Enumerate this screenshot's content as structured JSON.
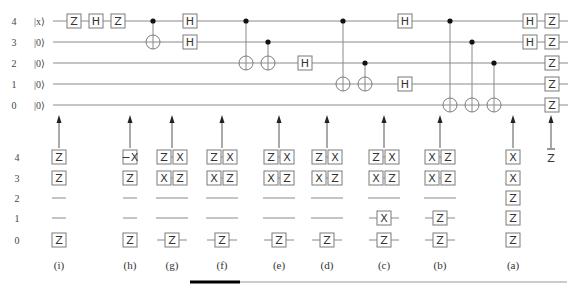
{
  "circuit": {
    "wires": [
      {
        "index": "4",
        "ket": "|x⟩",
        "y": 21
      },
      {
        "index": "3",
        "ket": "|0⟩",
        "y": 42
      },
      {
        "index": "2",
        "ket": "|0⟩",
        "y": 63
      },
      {
        "index": "1",
        "ket": "|0⟩",
        "y": 84
      },
      {
        "index": "0",
        "ket": "|0⟩",
        "y": 105
      }
    ],
    "wire_start_x": 53,
    "wire_end_x": 568,
    "gates": [
      {
        "label": "Z",
        "wire": 0,
        "x": 74
      },
      {
        "label": "H",
        "wire": 0,
        "x": 96
      },
      {
        "label": "Z",
        "wire": 0,
        "x": 118
      },
      {
        "label": "H",
        "wire": 0,
        "x": 190
      },
      {
        "label": "H",
        "wire": 1,
        "x": 190
      },
      {
        "label": "H",
        "wire": 2,
        "x": 305
      },
      {
        "label": "H",
        "wire": 0,
        "x": 405
      },
      {
        "label": "H",
        "wire": 3,
        "x": 405
      },
      {
        "label": "H",
        "wire": 0,
        "x": 530
      },
      {
        "label": "H",
        "wire": 1,
        "x": 530
      },
      {
        "label": "Z",
        "wire": 0,
        "x": 552
      },
      {
        "label": "Z",
        "wire": 1,
        "x": 552
      },
      {
        "label": "Z",
        "wire": 2,
        "x": 552
      },
      {
        "label": "Z",
        "wire": 3,
        "x": 552
      },
      {
        "label": "Z",
        "wire": 4,
        "x": 552
      }
    ],
    "cnots": [
      {
        "control": 0,
        "target": 1,
        "x": 153
      },
      {
        "control": 0,
        "target": 2,
        "x": 246
      },
      {
        "control": 1,
        "target": 2,
        "x": 268
      },
      {
        "control": 0,
        "target": 3,
        "x": 343
      },
      {
        "control": 2,
        "target": 3,
        "x": 365
      },
      {
        "control": 0,
        "target": 4,
        "x": 450
      },
      {
        "control": 1,
        "target": 4,
        "x": 472
      },
      {
        "control": 2,
        "target": 4,
        "x": 494
      }
    ]
  },
  "stabilizers": {
    "row_labels": [
      "4",
      "3",
      "2",
      "1",
      "0"
    ],
    "row_y": [
      157,
      178,
      198,
      218,
      240
    ],
    "caption_y": 265,
    "arrow_top_y": 115,
    "arrow_bottom_y": 148,
    "columns": [
      {
        "caption": "(i)",
        "x": 59,
        "rows": [
          [
            "Z"
          ],
          [
            "Z"
          ],
          [
            "—"
          ],
          [
            "—"
          ],
          [
            "Z"
          ]
        ],
        "wired": [
          false,
          false,
          false,
          false,
          false
        ]
      },
      {
        "caption": "(h)",
        "x": 130,
        "rows": [
          [
            "−X"
          ],
          [
            "Z"
          ],
          [
            "—"
          ],
          [
            "—"
          ],
          [
            "Z"
          ]
        ],
        "wired": [
          false,
          false,
          false,
          false,
          false
        ]
      },
      {
        "caption": "(g)",
        "x": 172,
        "rows": [
          [
            "Z",
            "X"
          ],
          [
            "X",
            "Z"
          ],
          [
            "—"
          ],
          [
            "—"
          ],
          [
            "Z"
          ]
        ],
        "wired": [
          false,
          false,
          false,
          false,
          true
        ]
      },
      {
        "caption": "(f)",
        "x": 222,
        "rows": [
          [
            "Z",
            "X"
          ],
          [
            "X",
            "Z"
          ],
          [
            "—"
          ],
          [
            "—"
          ],
          [
            "Z"
          ]
        ],
        "wired": [
          false,
          false,
          false,
          false,
          true
        ]
      },
      {
        "caption": "(e)",
        "x": 279,
        "rows": [
          [
            "Z",
            "X"
          ],
          [
            "X",
            "Z"
          ],
          [
            "—"
          ],
          [
            "—"
          ],
          [
            "Z"
          ]
        ],
        "wired": [
          false,
          false,
          false,
          false,
          true
        ]
      },
      {
        "caption": "(d)",
        "x": 327,
        "rows": [
          [
            "Z",
            "X"
          ],
          [
            "X",
            "Z"
          ],
          [
            "—"
          ],
          [
            "—"
          ],
          [
            "Z"
          ]
        ],
        "wired": [
          false,
          false,
          false,
          false,
          true
        ]
      },
      {
        "caption": "(c)",
        "x": 384,
        "rows": [
          [
            "Z",
            "X"
          ],
          [
            "X",
            "Z"
          ],
          [
            "—"
          ],
          [
            "X"
          ],
          [
            "Z"
          ]
        ],
        "wired": [
          false,
          false,
          false,
          true,
          true
        ]
      },
      {
        "caption": "(b)",
        "x": 440,
        "rows": [
          [
            "X",
            "Z"
          ],
          [
            "X",
            "Z"
          ],
          [
            "—"
          ],
          [
            "Z"
          ],
          [
            "Z"
          ]
        ],
        "wired": [
          false,
          false,
          false,
          true,
          true
        ]
      },
      {
        "caption": "(a)",
        "x": 513,
        "rows": [
          [
            "X"
          ],
          [
            "X"
          ],
          [
            "Z"
          ],
          [
            "Z"
          ],
          [
            "Z"
          ]
        ],
        "wired": [
          false,
          false,
          false,
          false,
          false
        ]
      }
    ],
    "final": {
      "label": "Z̄",
      "x": 551,
      "y": 157
    }
  },
  "footer_bar": {
    "black_from": 190,
    "black_to": 240,
    "gray_to": 567,
    "y": 282
  }
}
